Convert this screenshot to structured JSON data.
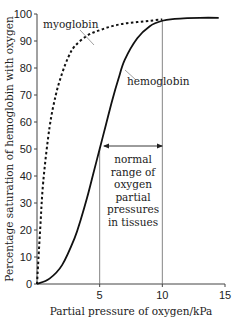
{
  "chart_data": {
    "type": "line",
    "title": "",
    "xlabel": "Partial pressure of oxygen/kPa",
    "ylabel": "Percentage saturation of hemoglobin with oxygen",
    "xlim": [
      0,
      15
    ],
    "ylim": [
      0,
      100
    ],
    "x_ticks": [
      5,
      10,
      15
    ],
    "x_tick_labels": [
      "5",
      "10",
      "15"
    ],
    "y_ticks": [
      0,
      10,
      20,
      30,
      40,
      50,
      60,
      70,
      80,
      90,
      100
    ],
    "y_tick_labels": [
      "0",
      "10",
      "20",
      "30",
      "40",
      "50",
      "60",
      "70",
      "80",
      "90",
      "100"
    ],
    "grid": false,
    "legend": "none (curves labelled directly)",
    "series": [
      {
        "name": "myoglobin",
        "style": "dashed",
        "x": [
          0,
          0.25,
          0.5,
          1,
          1.5,
          2,
          2.5,
          3,
          4,
          5,
          6,
          7,
          8,
          9,
          10
        ],
        "y": [
          0,
          20,
          38,
          58,
          70,
          78,
          84,
          88,
          92,
          94,
          95.5,
          96.5,
          97,
          97.5,
          98
        ]
      },
      {
        "name": "hemoglobin",
        "style": "solid",
        "x": [
          0,
          1,
          2,
          3,
          3.5,
          4,
          4.5,
          5,
          5.5,
          6,
          6.5,
          7,
          8,
          9,
          10,
          11,
          12,
          13,
          14.5
        ],
        "y": [
          0,
          2,
          7,
          17,
          24,
          32,
          41,
          50,
          59,
          68,
          76,
          83,
          91,
          95.5,
          97.5,
          98.2,
          98.5,
          98.6,
          98.6
        ]
      }
    ],
    "annotations": [
      {
        "text": "myoglobin",
        "points_to": "myoglobin curve"
      },
      {
        "text": "hemoglobin",
        "points_to": "hemoglobin curve"
      },
      {
        "text": "normal range of oxygen partial pressures in tissues",
        "range_x": [
          5,
          10
        ],
        "marker": "double-headed arrow at ~52%"
      }
    ],
    "reference_lines": [
      {
        "x": 5,
        "label": "lower bound of normal tissue range"
      },
      {
        "x": 10,
        "label": "upper bound of normal tissue range"
      }
    ]
  },
  "labels": {
    "myoglobin": "myoglobin",
    "hemoglobin": "hemoglobin",
    "range_lines": [
      "normal",
      "range of",
      "oxygen",
      "partial",
      "pressures",
      "in tissues"
    ]
  }
}
